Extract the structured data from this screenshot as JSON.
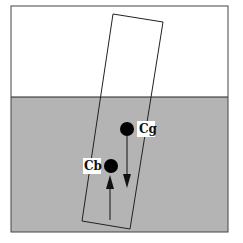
{
  "diagram": {
    "colors": {
      "air": "#ffffff",
      "water": "#b4b4b4",
      "stroke": "#222222",
      "dot": "#000000",
      "label_bg": "#ffffff"
    },
    "frame": {
      "x": 11,
      "y": 6,
      "width": 217,
      "height": 226
    },
    "water_line_y": 97,
    "body": {
      "points": "113,14 163,22 130,229 82,221"
    },
    "points": [
      {
        "id": "cg",
        "label": "Cg",
        "cx": 127,
        "cy": 129,
        "r": 7,
        "label_x": 137,
        "label_y": 121,
        "label_w": 18,
        "label_h": 16,
        "force": "down"
      },
      {
        "id": "cb",
        "label": "Cb",
        "cx": 111,
        "cy": 166,
        "r": 7,
        "label_x": 83,
        "label_y": 158,
        "label_w": 18,
        "label_h": 16,
        "force": "up"
      }
    ],
    "arrows": {
      "gravity": {
        "x": 127,
        "y1": 136,
        "y2": 187
      },
      "buoyancy": {
        "x": 110,
        "y1": 220,
        "y2": 175
      }
    }
  }
}
